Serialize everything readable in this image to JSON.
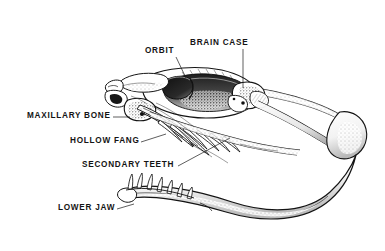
{
  "figure": {
    "background_color": "#ffffff",
    "ink_color": "#141414",
    "style": "pen-and-ink scientific illustration, black and white line art with stipple shading"
  },
  "labels": [
    {
      "id": "orbit",
      "text": "ORBIT",
      "leader": {
        "from": [
          176,
          57
        ],
        "to": [
          186,
          78
        ]
      }
    },
    {
      "id": "brain_case",
      "text": "BRAIN CASE",
      "leader": {
        "from": [
          243,
          49
        ],
        "to": [
          243,
          88
        ]
      }
    },
    {
      "id": "maxillary_bone",
      "text": "MAXILLARY BONE",
      "leader": {
        "from": [
          113,
          117
        ],
        "to": [
          130,
          117
        ]
      }
    },
    {
      "id": "hollow_fang",
      "text": "HOLLOW FANG",
      "leader": {
        "from": [
          141,
          142
        ],
        "to": [
          164,
          135
        ]
      }
    },
    {
      "id": "secondary_teeth",
      "text": "SECONDARY TEETH",
      "leader": {
        "from": [
          178,
          166
        ],
        "to": [
          228,
          139
        ]
      }
    },
    {
      "id": "lower_jaw",
      "text": "LOWER JAW",
      "leader": {
        "from": [
          117,
          209
        ],
        "to": [
          134,
          205
        ]
      }
    }
  ]
}
